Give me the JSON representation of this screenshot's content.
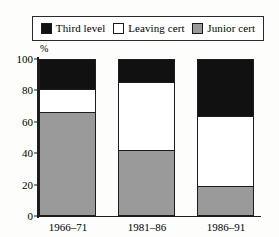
{
  "chart_data": {
    "type": "bar",
    "subtype": "stacked-100",
    "title": "",
    "xlabel": "",
    "ylabel": "%",
    "ylim": [
      0,
      100
    ],
    "yticks": [
      0,
      20,
      40,
      60,
      80,
      100
    ],
    "ytick_labels": [
      "0",
      "20",
      "40",
      "60",
      "80",
      "100"
    ],
    "grid": false,
    "legend_position": "top",
    "categories": [
      "1966–71",
      "1981–86",
      "1986–91"
    ],
    "series": [
      {
        "name": "Third level",
        "color": "#111111",
        "values": [
          19,
          14,
          36
        ]
      },
      {
        "name": "Leaving cert",
        "color": "#ffffff",
        "values": [
          15,
          45,
          46
        ]
      },
      {
        "name": "Junior cert",
        "color": "#9a9a9a",
        "values": [
          66,
          41,
          18
        ]
      }
    ],
    "segment_tops": {
      "1966–71": {
        "junior_cert_top": 66,
        "leaving_cert_top": 81,
        "third_level_top": 100
      },
      "1981–86": {
        "junior_cert_top": 41,
        "leaving_cert_top": 86,
        "third_level_top": 100
      },
      "1986–91": {
        "junior_cert_top": 18,
        "leaving_cert_top": 64,
        "third_level_top": 100
      }
    }
  },
  "legend": {
    "entries": [
      {
        "label": "Third level",
        "swatch": "black-swatch"
      },
      {
        "label": "Leaving cert",
        "swatch": "white-swatch"
      },
      {
        "label": "Junior cert",
        "swatch": "grey-swatch"
      }
    ]
  },
  "axis": {
    "y_unit_label": "%",
    "y_ticks": [
      "100",
      "80",
      "60",
      "40",
      "20",
      "0"
    ],
    "x_ticks": [
      "1966–71",
      "1981–86",
      "1986–91"
    ]
  }
}
